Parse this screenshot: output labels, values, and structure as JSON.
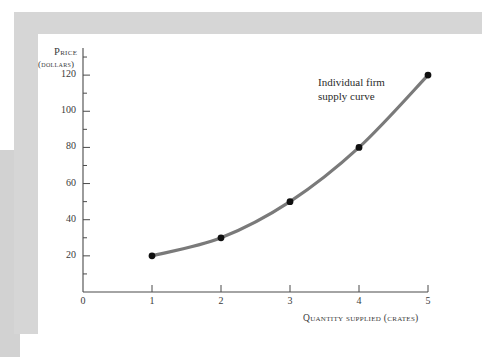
{
  "figure": {
    "background_color": "#ffffff",
    "frame_color": "#d6d6d6",
    "panel_color": "#ffffff",
    "left_band_color": "#d2d2d2"
  },
  "chart_data": {
    "type": "line",
    "title": "",
    "subtitle": "",
    "xlabel": "Quantity supplied (crates)",
    "ylabel": "Price",
    "ylabel_sub": "(dollars)",
    "x": [
      1,
      2,
      3,
      4,
      5
    ],
    "values": [
      20,
      30,
      50,
      80,
      120
    ],
    "series": [
      {
        "name": "Individual firm supply curve",
        "x": [
          1,
          2,
          3,
          4,
          5
        ],
        "values": [
          20,
          30,
          50,
          80,
          120
        ]
      }
    ],
    "xlim": [
      0,
      5
    ],
    "ylim": [
      0,
      135
    ],
    "x_ticks": [
      0,
      1,
      2,
      3,
      4,
      5
    ],
    "x_tick_labels": [
      "0",
      "1",
      "2",
      "3",
      "4",
      "5"
    ],
    "y_ticks": [
      20,
      40,
      60,
      80,
      100,
      120
    ],
    "y_tick_labels": [
      "20",
      "40",
      "60",
      "80",
      "100",
      "120"
    ],
    "y_minor_ticks": [
      10,
      30,
      50,
      70,
      90,
      110,
      130
    ],
    "grid": false,
    "legend": "none",
    "line_color": "#7a7a7a",
    "marker_color": "#101010",
    "axis_color": "#4a4a4a",
    "annotations": [
      {
        "text": "Individual firm\nsupply curve",
        "x": 3.85,
        "y": 120
      }
    ]
  }
}
